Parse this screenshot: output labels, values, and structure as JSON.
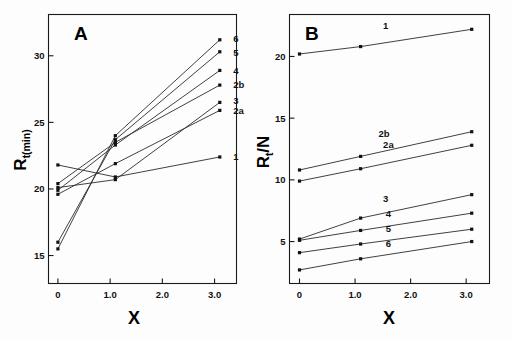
{
  "figure": {
    "background": "#ffffff",
    "line_color": "#2b2b2b",
    "marker_color": "#111111"
  },
  "panels": [
    {
      "id": "A",
      "label": "A",
      "xlabel": "X",
      "ylabel_main": "R",
      "ylabel_sub": "t",
      "ylabel_paren": "(min)",
      "ylabel_full": "Rt(min)",
      "xticks": [
        "0",
        "1.0",
        "2.0",
        "3.0"
      ],
      "xtick_values": [
        0,
        1.0,
        2.0,
        3.0
      ],
      "yticks": [
        "15",
        "20",
        "25",
        "30"
      ],
      "ytick_values": [
        15,
        20,
        25,
        30
      ],
      "xlim": [
        -0.18,
        3.42
      ],
      "ylim": [
        12.9,
        33.1
      ],
      "series_labels": [
        "1",
        "2a",
        "2b",
        "3",
        "4",
        "5",
        "6"
      ]
    },
    {
      "id": "B",
      "label": "B",
      "xlabel": "X",
      "ylabel_main": "R",
      "ylabel_sub": "t",
      "ylabel_slash": "/",
      "ylabel_n": "N",
      "ylabel_full": "Rt/N",
      "xticks": [
        "0",
        "1.0",
        "2.0",
        "3.0"
      ],
      "xtick_values": [
        0,
        1.0,
        2.0,
        3.0
      ],
      "yticks": [
        "5",
        "10",
        "15",
        "20"
      ],
      "ytick_values": [
        5,
        10,
        15,
        20
      ],
      "xlim": [
        -0.18,
        3.42
      ],
      "ylim": [
        1.6,
        23.4
      ],
      "series_labels": [
        "1",
        "2a",
        "2b",
        "3",
        "4",
        "5",
        "6"
      ]
    }
  ],
  "chart_data": [
    {
      "type": "line",
      "panel": "A",
      "title": "A",
      "xlabel": "X",
      "ylabel": "Rt (min)",
      "xlim": [
        -0.18,
        3.42
      ],
      "ylim": [
        12.9,
        33.1
      ],
      "xticks": [
        0,
        1.0,
        2.0,
        3.0
      ],
      "yticks": [
        15,
        20,
        25,
        30
      ],
      "grid": false,
      "legend": "inline-right-end-labels",
      "x": [
        0,
        1.1,
        3.1
      ],
      "series": [
        {
          "name": "1",
          "values": [
            21.8,
            20.9,
            22.4
          ],
          "label_x": 3.28,
          "label_y": 22.4
        },
        {
          "name": "2a",
          "values": [
            19.6,
            21.9,
            25.9
          ],
          "label_x": 3.28,
          "label_y": 25.9
        },
        {
          "name": "2b",
          "values": [
            20.4,
            23.5,
            27.8
          ],
          "label_x": 3.28,
          "label_y": 27.8
        },
        {
          "name": "3",
          "values": [
            20.1,
            20.7,
            26.5
          ],
          "label_x": 3.28,
          "label_y": 26.6
        },
        {
          "name": "4",
          "values": [
            19.9,
            23.3,
            28.9
          ],
          "label_x": 3.28,
          "label_y": 28.9
        },
        {
          "name": "5",
          "values": [
            16.0,
            23.7,
            30.3
          ],
          "label_x": 3.28,
          "label_y": 30.2
        },
        {
          "name": "6",
          "values": [
            15.5,
            24.0,
            31.2
          ],
          "label_x": 3.28,
          "label_y": 31.3
        }
      ]
    },
    {
      "type": "line",
      "panel": "B",
      "title": "B",
      "xlabel": "X",
      "ylabel": "Rt/N",
      "xlim": [
        -0.18,
        3.42
      ],
      "ylim": [
        1.6,
        23.4
      ],
      "xticks": [
        0,
        1.0,
        2.0,
        3.0
      ],
      "yticks": [
        5,
        10,
        15,
        20
      ],
      "grid": false,
      "legend": "inline-above-line-labels",
      "x": [
        0,
        1.1,
        3.1
      ],
      "series": [
        {
          "name": "1",
          "values": [
            20.2,
            20.8,
            22.2
          ],
          "label_x": 1.55,
          "label_y": 22.0
        },
        {
          "name": "2a",
          "values": [
            9.9,
            10.9,
            12.8
          ],
          "label_x": 1.6,
          "label_y": 12.3
        },
        {
          "name": "2b",
          "values": [
            10.8,
            11.9,
            13.9
          ],
          "label_x": 1.52,
          "label_y": 13.2
        },
        {
          "name": "3",
          "values": [
            5.2,
            6.9,
            8.8
          ],
          "label_x": 1.55,
          "label_y": 8.0
        },
        {
          "name": "4",
          "values": [
            5.1,
            5.9,
            7.3
          ],
          "label_x": 1.6,
          "label_y": 6.75
        },
        {
          "name": "5",
          "values": [
            4.1,
            4.8,
            6.0
          ],
          "label_x": 1.6,
          "label_y": 5.5
        },
        {
          "name": "6",
          "values": [
            2.7,
            3.6,
            5.0
          ],
          "label_x": 1.6,
          "label_y": 4.3
        }
      ]
    }
  ]
}
